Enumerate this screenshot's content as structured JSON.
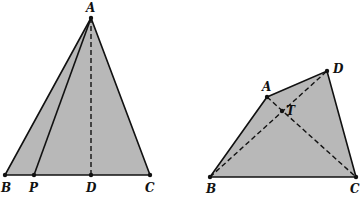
{
  "figures": [
    {
      "name": "left-triangle",
      "points": {
        "A": {
          "label": "A",
          "x": 91,
          "y": 18
        },
        "B": {
          "label": "B",
          "x": 5,
          "y": 175
        },
        "P": {
          "label": "P",
          "x": 34,
          "y": 175
        },
        "D": {
          "label": "D",
          "x": 91,
          "y": 175
        },
        "C": {
          "label": "C",
          "x": 150,
          "y": 175
        }
      },
      "segments_solid": [
        "AB",
        "AC",
        "BC",
        "AP"
      ],
      "segments_dashed": [
        "AD"
      ]
    },
    {
      "name": "right-quadrilateral",
      "points": {
        "A": {
          "label": "A",
          "x": 267,
          "y": 97
        },
        "D": {
          "label": "D",
          "x": 327,
          "y": 71
        },
        "T": {
          "label": "T",
          "x": 282,
          "y": 111
        },
        "B": {
          "label": "B",
          "x": 210,
          "y": 177
        },
        "C": {
          "label": "C",
          "x": 356,
          "y": 177
        }
      },
      "segments_solid": [
        "AB",
        "AD",
        "DC",
        "BC"
      ],
      "segments_dashed": [
        "BD",
        "AC"
      ]
    }
  ],
  "colors": {
    "fill": "#b8b8b8",
    "stroke": "#111111"
  }
}
